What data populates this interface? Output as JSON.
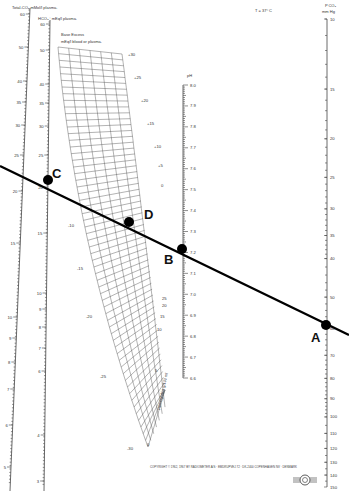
{
  "diagram": {
    "temperature_label": "T = 37° C",
    "axes": {
      "total_co2": {
        "label": "Total-CO₂ mMol/l plasma.",
        "ticks": [
          {
            "v": "60",
            "y": 14
          },
          {
            "v": "50",
            "y": 47
          },
          {
            "v": "40",
            "y": 81
          },
          {
            "v": "35",
            "y": 102
          },
          {
            "v": "30",
            "y": 125
          },
          {
            "v": "25",
            "y": 155
          },
          {
            "v": "20",
            "y": 191
          },
          {
            "v": "15",
            "y": 243
          },
          {
            "v": "10",
            "y": 317
          },
          {
            "v": "9",
            "y": 338
          },
          {
            "v": "8",
            "y": 362
          },
          {
            "v": "7",
            "y": 389
          },
          {
            "v": "6",
            "y": 425
          },
          {
            "v": "5",
            "y": 467
          }
        ]
      },
      "hco3": {
        "label": "HCO₃⁻ mEq/l plasma.",
        "ticks": [
          {
            "v": "60",
            "y": 24
          },
          {
            "v": "50",
            "y": 50
          },
          {
            "v": "40",
            "y": 84
          },
          {
            "v": "35",
            "y": 103
          },
          {
            "v": "30",
            "y": 126
          },
          {
            "v": "25",
            "y": 155
          },
          {
            "v": "20",
            "y": 187
          },
          {
            "v": "15",
            "y": 233
          },
          {
            "v": "10",
            "y": 293
          },
          {
            "v": "9",
            "y": 309
          },
          {
            "v": "8",
            "y": 327
          },
          {
            "v": "7",
            "y": 348
          },
          {
            "v": "6",
            "y": 371
          },
          {
            "v": "4",
            "y": 435
          },
          {
            "v": "3",
            "y": 481
          }
        ]
      },
      "base_excess": {
        "label_line1": "Base Excess",
        "label_line2": "mEq/l blood or plasma.",
        "right_labels": [
          "+30",
          "+25",
          "+20",
          "+15",
          "+10",
          "+5",
          "0"
        ],
        "left_labels": [
          "-10",
          "-15",
          "-20",
          "-25",
          "-30"
        ]
      },
      "hemoglobin": {
        "label": "Hemoglobin g/100 ml",
        "labels": [
          "25",
          "20",
          "15",
          "10",
          "5",
          "0"
        ]
      },
      "ph": {
        "label": "pH",
        "ticks": [
          "8.0",
          "7.9",
          "7.8",
          "7.7",
          "7.6",
          "7.5",
          "7.4",
          "7.3",
          "7.2",
          "7.1",
          "7.0",
          "6.9",
          "6.8",
          "6.7",
          "6.6"
        ]
      },
      "pco2": {
        "label_line1": "P CO₂",
        "label_line2": "mm Hg",
        "ticks": [
          "10",
          "15",
          "20",
          "25",
          "30",
          "35",
          "40",
          "50",
          "60",
          "70",
          "80",
          "90",
          "100",
          "110",
          "120",
          "130",
          "140",
          "150"
        ]
      }
    },
    "points": [
      {
        "name": "A",
        "description": "PCO2 ≈ 68 mm Hg"
      },
      {
        "name": "B",
        "description": "pH ≈ 7.15"
      },
      {
        "name": "C",
        "description": "HCO3 ≈ 21 mEq/l"
      },
      {
        "name": "D",
        "description": "Base excess ≈ -7 mEq/l"
      }
    ],
    "copyright": "COPYRIGHT © 1962, 1967 BY RADIOMETER A/S · EMDRUPVEJ 72 · DK-2400 COPENHAGEN NV · DENMARK",
    "logo": "radiometer-logo-icon"
  }
}
